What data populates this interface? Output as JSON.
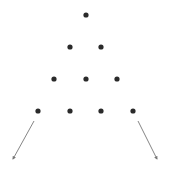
{
  "diagram": {
    "background": "#ffffff",
    "dot_color": "#2a2a2a",
    "arrow_color": "#777777",
    "dot_radius": 2.6,
    "rows": [
      {
        "count": 1,
        "dots": [
          [
            86,
            15
          ]
        ]
      },
      {
        "count": 2,
        "dots": [
          [
            70,
            47
          ],
          [
            101,
            47
          ]
        ]
      },
      {
        "count": 3,
        "dots": [
          [
            54,
            79
          ],
          [
            86,
            79
          ],
          [
            117,
            79
          ]
        ]
      },
      {
        "count": 4,
        "dots": [
          [
            38,
            111
          ],
          [
            70,
            111
          ],
          [
            101,
            111
          ],
          [
            133,
            111
          ]
        ]
      }
    ],
    "arrows": [
      {
        "name": "left-arrow",
        "from": [
          34,
          121
        ],
        "to": [
          13,
          159
        ]
      },
      {
        "name": "right-arrow",
        "from": [
          138,
          121
        ],
        "to": [
          157,
          159
        ]
      }
    ]
  }
}
